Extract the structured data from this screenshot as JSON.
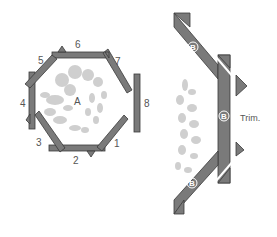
{
  "diagram": {
    "left_panel": {
      "center_label": "A",
      "piece_labels": [
        "1",
        "2",
        "3",
        "4",
        "5",
        "6",
        "7",
        "8"
      ]
    },
    "right_panel": {
      "strip_labels": [
        "B",
        "B",
        "B"
      ],
      "trim_label": "Trim."
    },
    "colors": {
      "strip_fill": "#7a7a7a",
      "strip_stroke": "#3a3a3a",
      "pattern_fill": "#cfcfcf",
      "label_color": "#555555",
      "background": "#ffffff"
    }
  }
}
